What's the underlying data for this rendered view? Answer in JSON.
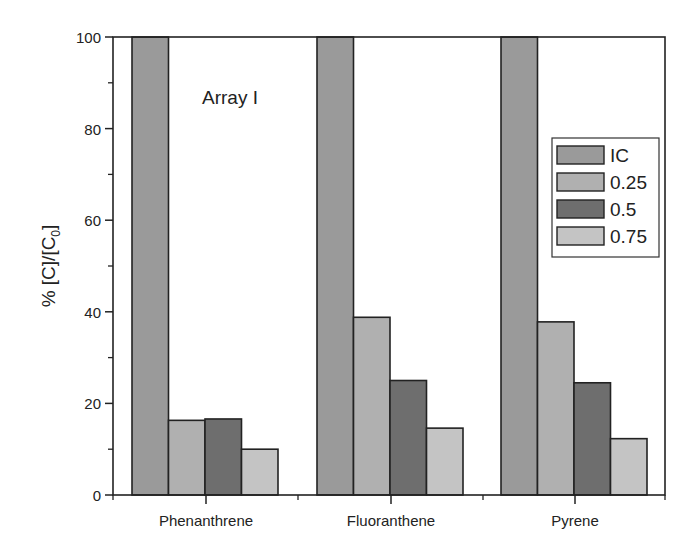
{
  "chart_data": {
    "type": "bar",
    "title": "",
    "annotation": "Array I",
    "xlabel": "",
    "ylabel": "% [C]/[C0]",
    "ylabel_parts": {
      "prefix": "% [C]/[C",
      "subscript": "0",
      "suffix": "]"
    },
    "ylim": [
      0,
      100
    ],
    "yticks": [
      0,
      20,
      40,
      60,
      80,
      100
    ],
    "yminor_ticks": [
      10,
      30,
      50,
      70,
      90
    ],
    "grid": false,
    "legend_position": "upper right",
    "categories": [
      "Phenanthrene",
      "Fluoranthene",
      "Pyrene"
    ],
    "series": [
      {
        "name": "IC",
        "color": "#9a9a9a",
        "values": [
          100,
          100,
          100
        ]
      },
      {
        "name": "0.25",
        "color": "#b0b0b0",
        "values": [
          16.3,
          38.8,
          37.8
        ]
      },
      {
        "name": "0.5",
        "color": "#6e6e6e",
        "values": [
          16.6,
          25.0,
          24.5
        ]
      },
      {
        "name": "0.75",
        "color": "#c4c4c4",
        "values": [
          10.0,
          14.6,
          12.3
        ]
      }
    ]
  }
}
